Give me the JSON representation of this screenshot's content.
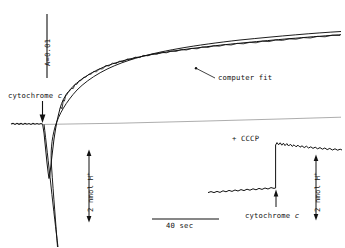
{
  "figure": {
    "background": "#ffffff",
    "ink": "#111111",
    "faint_ink": "#6b6b6b",
    "width": 345,
    "height": 248
  },
  "labels": {
    "absorbance_scale": "A=0.01",
    "cytochrome_main": "cytochrome c",
    "computer_fit": "computer fit",
    "proton_scale_main": "2 nmol H",
    "proton_scale_sup": "+",
    "time_scale": "40 sec",
    "cccp": "+ CCCP",
    "cytochrome_inset": "cytochrome c",
    "proton_scale_inset": "2 nmol H",
    "proton_scale_inset_sup": "+"
  },
  "chart_data": {
    "type": "line",
    "title": "",
    "xlabel": "time",
    "ylabel": "absorbance / proton uptake",
    "axis_ranges": {
      "x_px": [
        0,
        345
      ],
      "y_px": [
        0,
        248
      ]
    },
    "grid": false,
    "legend": "inline-annotation",
    "scale_bars": [
      {
        "name": "absorbance",
        "label": "A=0.01",
        "orientation": "vertical",
        "x": 47,
        "y_top": 14,
        "y_bottom": 78
      },
      {
        "name": "proton-main",
        "label": "2 nmol H+",
        "orientation": "vertical",
        "x": 89,
        "y_top": 150,
        "y_bottom": 222,
        "arrowheads": "both"
      },
      {
        "name": "time",
        "label": "40 sec",
        "orientation": "horizontal",
        "y": 219,
        "x_left": 152,
        "x_right": 219
      },
      {
        "name": "proton-inset",
        "label": "2 nmol H+",
        "orientation": "vertical",
        "x": 316,
        "y_top": 155,
        "y_bottom": 220,
        "arrowheads": "both"
      }
    ],
    "annotations": [
      {
        "text": "cytochrome c",
        "x": 8,
        "y": 95,
        "arrow": "down",
        "arrow_x": 42,
        "arrow_y_from": 100,
        "arrow_y_to": 121
      },
      {
        "text": "computer fit",
        "x": 218,
        "y": 78,
        "leader_to_x": 196,
        "leader_to_y": 68
      },
      {
        "text": "+ CCCP",
        "x": 232,
        "y": 138
      },
      {
        "text": "cytochrome c",
        "x": 246,
        "y": 214,
        "arrow": "up",
        "arrow_x": 276,
        "arrow_y_from": 207,
        "arrow_y_to": 190
      }
    ],
    "series": [
      {
        "name": "experimental trace (noisy data)",
        "style": "noisy-solid",
        "description": "flat baseline, sharp downward spike on cytochrome c addition, then exponential recovery rising above baseline",
        "points": [
          [
            12,
            124
          ],
          [
            16,
            124
          ],
          [
            20,
            123
          ],
          [
            24,
            124
          ],
          [
            28,
            123
          ],
          [
            32,
            124
          ],
          [
            36,
            123
          ],
          [
            40,
            124
          ],
          [
            43,
            130
          ],
          [
            45,
            146
          ],
          [
            47,
            162
          ],
          [
            48,
            172
          ],
          [
            49,
            178
          ],
          [
            50,
            174
          ],
          [
            51,
            166
          ],
          [
            53,
            152
          ],
          [
            55,
            138
          ],
          [
            57,
            126
          ],
          [
            59,
            116
          ],
          [
            62,
            106
          ],
          [
            65,
            99
          ],
          [
            68,
            93
          ],
          [
            72,
            88
          ],
          [
            76,
            83
          ],
          [
            80,
            79
          ],
          [
            85,
            75
          ],
          [
            90,
            71
          ],
          [
            96,
            68
          ],
          [
            102,
            65
          ],
          [
            108,
            62
          ],
          [
            115,
            60
          ],
          [
            122,
            58
          ],
          [
            130,
            56
          ],
          [
            138,
            54
          ],
          [
            146,
            52
          ],
          [
            155,
            50
          ],
          [
            164,
            49
          ],
          [
            173,
            47
          ],
          [
            182,
            46
          ],
          [
            192,
            45
          ],
          [
            202,
            43
          ],
          [
            212,
            42
          ],
          [
            222,
            41
          ],
          [
            232,
            40
          ],
          [
            242,
            39
          ],
          [
            252,
            38
          ],
          [
            262,
            37
          ],
          [
            272,
            36
          ],
          [
            282,
            35
          ],
          [
            292,
            34
          ],
          [
            302,
            33
          ],
          [
            312,
            32
          ],
          [
            322,
            31
          ],
          [
            332,
            30
          ],
          [
            340,
            30
          ]
        ]
      },
      {
        "name": "computer fit (smooth)",
        "style": "smooth-solid",
        "description": "single-exponential fit drawn through and below the data, extending off the bottom of the plot",
        "points": [
          [
            44,
            124
          ],
          [
            47,
            150
          ],
          [
            50,
            180
          ],
          [
            53,
            208
          ],
          [
            56,
            232
          ],
          [
            58,
            246
          ],
          [
            57,
            240
          ],
          [
            55,
            214
          ],
          [
            53,
            188
          ],
          [
            51,
            164
          ],
          [
            50,
            150
          ],
          [
            52,
            136
          ],
          [
            55,
            124
          ],
          [
            58,
            114
          ],
          [
            62,
            105
          ],
          [
            66,
            98
          ],
          [
            71,
            92
          ],
          [
            77,
            86
          ],
          [
            84,
            81
          ],
          [
            92,
            76
          ],
          [
            101,
            72
          ],
          [
            111,
            68
          ],
          [
            122,
            64
          ],
          [
            134,
            61
          ],
          [
            147,
            58
          ],
          [
            161,
            56
          ],
          [
            176,
            53
          ],
          [
            192,
            51
          ],
          [
            209,
            49
          ],
          [
            227,
            47
          ],
          [
            246,
            45
          ],
          [
            266,
            43
          ],
          [
            287,
            41
          ],
          [
            309,
            39
          ],
          [
            332,
            37
          ],
          [
            341,
            36
          ]
        ]
      },
      {
        "name": "baseline drift reference",
        "style": "thin-faint",
        "description": "near-horizontal faint reference line drifting slightly upward to the right",
        "points": [
          [
            45,
            124
          ],
          [
            120,
            123
          ],
          [
            200,
            121
          ],
          [
            280,
            119
          ],
          [
            341,
            117
          ]
        ]
      }
    ],
    "inset": {
      "name": "+ CCCP control",
      "type": "line",
      "description": "uncoupler control: low noisy baseline, instantaneous step up on cytochrome c addition, then slow noisy decay",
      "series": [
        {
          "name": "CCCP trace",
          "style": "noisy-solid",
          "points": [
            [
              210,
              192
            ],
            [
              215,
              191
            ],
            [
              220,
              192
            ],
            [
              226,
              190
            ],
            [
              232,
              190
            ],
            [
              238,
              189
            ],
            [
              244,
              189
            ],
            [
              250,
              188
            ],
            [
              256,
              188
            ],
            [
              262,
              187
            ],
            [
              268,
              187
            ],
            [
              273,
              186
            ],
            [
              275,
              186
            ],
            [
              276,
              160
            ],
            [
              277,
              144
            ],
            [
              278,
              143
            ],
            [
              281,
              145
            ],
            [
              284,
              143
            ],
            [
              287,
              146
            ],
            [
              290,
              144
            ],
            [
              294,
              146
            ],
            [
              298,
              145
            ],
            [
              302,
              147
            ],
            [
              306,
              146
            ],
            [
              310,
              148
            ],
            [
              314,
              147
            ],
            [
              318,
              149
            ],
            [
              322,
              148
            ],
            [
              326,
              150
            ],
            [
              330,
              149
            ],
            [
              334,
              151
            ],
            [
              338,
              150
            ],
            [
              341,
              151
            ]
          ]
        }
      ]
    }
  }
}
